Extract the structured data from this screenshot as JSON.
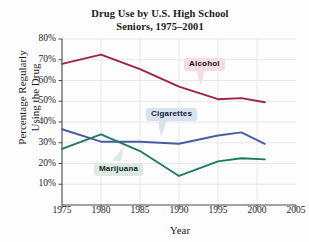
{
  "chart_data": {
    "type": "line",
    "title": "Drug Use by U.S. High School Seniors, 1975–2001",
    "title_line1": "Drug Use by U.S. High School",
    "title_line2": "Seniors, 1975–2001",
    "xlabel": "Year",
    "ylabel": "Percentage Regularly Using the Drug",
    "ylabel_line1": "Percentage Regularly",
    "ylabel_line2": "Using the Drug",
    "xlim": [
      1975,
      2005
    ],
    "ylim": [
      0,
      80
    ],
    "xticks": [
      1975,
      1980,
      1985,
      1990,
      1995,
      2000,
      2005
    ],
    "xtick_labels": [
      "1975",
      "1980",
      "1985",
      "1990",
      "1995",
      "2000",
      "2005"
    ],
    "yticks": [
      10,
      20,
      30,
      40,
      50,
      60,
      70,
      80
    ],
    "ytick_labels": [
      "10%",
      "20%",
      "30%",
      "40%",
      "50%",
      "60%",
      "70%",
      "80%"
    ],
    "grid": true,
    "legend_position": "inline-callouts",
    "series": [
      {
        "name": "Alcohol",
        "color": "#9e2342",
        "x": [
          1975,
          1980,
          1985,
          1990,
          1995,
          1998,
          2001
        ],
        "values": [
          68,
          72.5,
          65.5,
          57,
          51,
          51.5,
          49.5
        ]
      },
      {
        "name": "Cigarettes",
        "color": "#4a5ba6",
        "x": [
          1975,
          1980,
          1985,
          1990,
          1995,
          1998,
          2001
        ],
        "values": [
          36.5,
          30.5,
          30.5,
          29.5,
          33.5,
          35,
          29.5
        ]
      },
      {
        "name": "Marijuana",
        "color": "#1f7a63",
        "x": [
          1975,
          1980,
          1985,
          1990,
          1995,
          1998,
          2001
        ],
        "values": [
          27,
          34,
          26,
          14,
          21,
          22.5,
          22
        ]
      }
    ],
    "annotations": [
      {
        "label": "Alcohol",
        "series": "Alcohol",
        "box_color": "#f3dfe3"
      },
      {
        "label": "Cigarettes",
        "series": "Cigarettes",
        "box_color": "#d8e3f0"
      },
      {
        "label": "Marijuana",
        "series": "Marijuana",
        "box_color": "#dde9e2"
      }
    ]
  }
}
